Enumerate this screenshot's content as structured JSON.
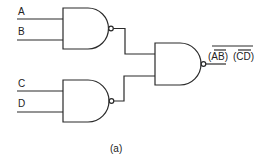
{
  "diagram": {
    "title": "",
    "caption": "(a)",
    "inputs": [
      {
        "id": "A",
        "label": "A"
      },
      {
        "id": "B",
        "label": "B"
      },
      {
        "id": "C",
        "label": "C"
      },
      {
        "id": "D",
        "label": "D"
      }
    ],
    "gates": [
      {
        "id": "g1",
        "type": "NAND",
        "inputs": [
          "A",
          "B"
        ]
      },
      {
        "id": "g2",
        "type": "NAND",
        "inputs": [
          "C",
          "D"
        ]
      },
      {
        "id": "g3",
        "type": "NAND",
        "inputs": [
          "g1",
          "g2"
        ]
      }
    ],
    "output": {
      "label_part1": "(AB)",
      "label_part2": "(CD)",
      "inner_overline_1": "AB",
      "inner_overline_2": "CD",
      "full_overline": true
    },
    "colors": {
      "line": "#2a2a2a",
      "background": "#ffffff"
    }
  }
}
